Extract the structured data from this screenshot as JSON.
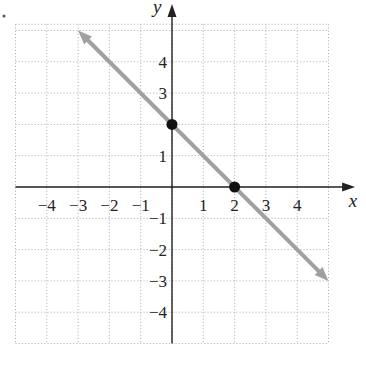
{
  "chart_data": {
    "type": "line",
    "title": "",
    "xlabel": "x",
    "ylabel": "y",
    "xlim": [
      -5,
      5
    ],
    "ylim": [
      -5,
      5
    ],
    "grid": true,
    "x_ticks": [
      -4,
      -3,
      -2,
      -1,
      1,
      2,
      3,
      4
    ],
    "y_ticks": [
      -4,
      -3,
      -2,
      -1,
      1,
      3,
      4
    ],
    "x_tick_labels": [
      "−4",
      "−3",
      "−2",
      "−1",
      "1",
      "2",
      "3",
      "4"
    ],
    "y_tick_labels": [
      "−4",
      "−3",
      "−2",
      "−1",
      "1",
      "3",
      "4"
    ],
    "series": [
      {
        "name": "line",
        "equation": "y = -x + 2",
        "x": [
          -3,
          5
        ],
        "y": [
          5,
          -3
        ],
        "color": "#a0a0a0",
        "arrows": "both"
      }
    ],
    "points": [
      {
        "x": 0,
        "y": 2,
        "label": "y-intercept"
      },
      {
        "x": 2,
        "y": 0,
        "label": "x-intercept"
      }
    ]
  },
  "colors": {
    "axis": "#222222",
    "grid": "#b8b8b8",
    "line": "#a0a0a0",
    "point": "#111111"
  }
}
